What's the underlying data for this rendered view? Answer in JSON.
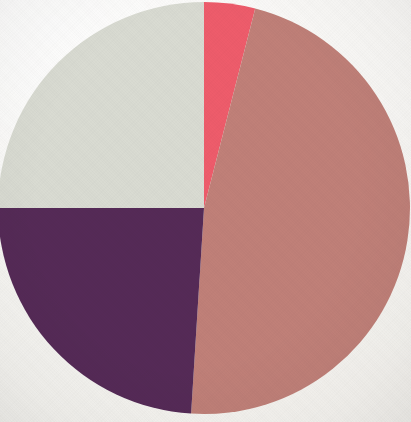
{
  "figure": {
    "background_color": "#f7f6f3",
    "width": 411,
    "height": 422
  },
  "chart_data": {
    "type": "pie",
    "title": "",
    "subtitle": "",
    "xlabel": "",
    "ylabel": "",
    "grid": false,
    "legend": "none",
    "labels_shown": false,
    "start_angle_deg": 0,
    "direction": "clockwise",
    "center_x": 204,
    "center_y": 208,
    "radius": 206,
    "categories": [
      "Slice 1",
      "Slice 2",
      "Slice 3",
      "Slice 4"
    ],
    "values": [
      4,
      47,
      24,
      25
    ],
    "units": "percent",
    "colors": [
      "#ee5c6b",
      "#c08078",
      "#552a57",
      "#d9dbd2"
    ],
    "slices": [
      {
        "name": "Slice 1",
        "color_name": "bright-pink",
        "color": "#ee5c6b",
        "value": 4,
        "percent": "4%",
        "start_angle_deg": 0,
        "end_angle_deg": 14.4
      },
      {
        "name": "Slice 2",
        "color_name": "rosy-salmon",
        "color": "#c08078",
        "value": 47,
        "percent": "47%",
        "start_angle_deg": 14.4,
        "end_angle_deg": 183.6
      },
      {
        "name": "Slice 3",
        "color_name": "dark-purple",
        "color": "#552a57",
        "value": 24,
        "percent": "24%",
        "start_angle_deg": 183.6,
        "end_angle_deg": 270.0
      },
      {
        "name": "Slice 4",
        "color_name": "light-grey",
        "color": "#d9dbd2",
        "value": 25,
        "percent": "25%",
        "start_angle_deg": 270.0,
        "end_angle_deg": 360.0
      }
    ]
  }
}
